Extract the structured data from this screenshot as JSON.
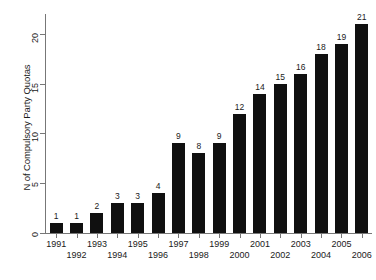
{
  "chart_data": {
    "type": "bar",
    "title": "",
    "subtitle": "",
    "xlabel": "",
    "ylabel": "N of Compulsory Party Quotas",
    "categories": [
      "1991",
      "1992",
      "1993",
      "1994",
      "1995",
      "1996",
      "1997",
      "1998",
      "1999",
      "2000",
      "2001",
      "2002",
      "2003",
      "2004",
      "2005",
      "2006"
    ],
    "values": [
      1,
      1,
      2,
      3,
      3,
      4,
      9,
      8,
      9,
      12,
      14,
      15,
      16,
      18,
      19,
      21
    ],
    "data_labels": [
      "1",
      "1",
      "2",
      "3",
      "3",
      "4",
      "9",
      "8",
      "9",
      "12",
      "14",
      "15",
      "16",
      "18",
      "19",
      "21"
    ],
    "ylim": [
      0,
      22
    ],
    "y_ticks": [
      0,
      5,
      10,
      15,
      20
    ],
    "y_tick_labels": [
      "0",
      "5",
      "10",
      "15",
      "20"
    ],
    "grid": false,
    "legend": null,
    "bar_color": "#101010",
    "axis_color": "#777777",
    "background_color": "#ffffff",
    "tick_label_rows": {
      "top": [
        "1991",
        "1993",
        "1995",
        "1997",
        "1999",
        "2001",
        "2003",
        "2005"
      ],
      "bottom": [
        "1992",
        "1994",
        "1996",
        "1998",
        "2000",
        "2002",
        "2004",
        "2006"
      ]
    }
  },
  "figure": {
    "caption": ""
  }
}
